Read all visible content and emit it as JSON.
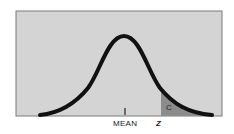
{
  "diagram": {
    "type": "normal-distribution-curve",
    "labels": {
      "mean": "MEAN",
      "z": "Z",
      "tail_area": "C"
    },
    "colors": {
      "background_panel": "#d4d4d4",
      "panel_border": "#7a7a7a",
      "curve": "#111111",
      "shaded_tail": "#8c8c8c",
      "text": "#222222"
    }
  }
}
